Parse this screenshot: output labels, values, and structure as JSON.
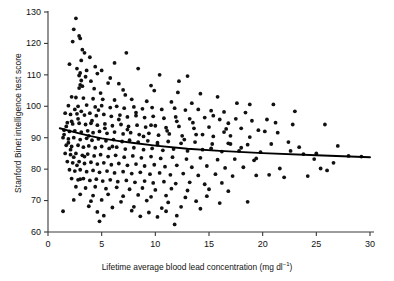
{
  "chart_data": {
    "type": "scatter",
    "title": "",
    "xlabel": "Lifetime average blood lead concentration (mg dl",
    "xlabel_sup": "−1",
    "xlabel_close": ")",
    "ylabel": "Stanford Binet intelligence test score",
    "xlim": [
      0,
      30
    ],
    "ylim": [
      60,
      130
    ],
    "xticks": [
      0,
      5,
      10,
      15,
      20,
      25,
      30
    ],
    "yticks": [
      60,
      70,
      80,
      90,
      100,
      110,
      120,
      130
    ],
    "grid": false,
    "legend": null,
    "point_color": "#111111",
    "point_radius": 1.9,
    "fit_color": "#000000",
    "fit_line": {
      "name": "regression fit",
      "x": [
        1.1,
        2.0,
        3.0,
        4.0,
        5.0,
        6.5,
        8.0,
        10.0,
        13.0,
        16.0,
        20.0,
        25.0,
        30.0
      ],
      "y": [
        93.0,
        92.2,
        91.3,
        90.5,
        89.8,
        89.0,
        88.3,
        87.5,
        86.5,
        85.8,
        85.1,
        84.4,
        83.8
      ]
    },
    "points": [
      [
        2.6,
        128.0
      ],
      [
        2.4,
        124.5
      ],
      [
        2.9,
        122.4
      ],
      [
        3.0,
        121.6
      ],
      [
        2.3,
        120.6
      ],
      [
        3.2,
        118.0
      ],
      [
        3.4,
        117.0
      ],
      [
        7.3,
        117.0
      ],
      [
        3.9,
        115.6
      ],
      [
        3.1,
        114.6
      ],
      [
        3.0,
        110.6
      ],
      [
        4.6,
        110.4
      ],
      [
        2.9,
        109.8
      ],
      [
        3.5,
        109.4
      ],
      [
        13.0,
        109.6
      ],
      [
        3.1,
        108.2
      ],
      [
        4.0,
        108.0
      ],
      [
        5.6,
        107.4
      ],
      [
        6.6,
        107.2
      ],
      [
        3.0,
        106.8
      ],
      [
        3.2,
        106.4
      ],
      [
        9.6,
        106.6
      ],
      [
        2.9,
        105.8
      ],
      [
        4.3,
        105.6
      ],
      [
        7.0,
        105.2
      ],
      [
        9.9,
        105.0
      ],
      [
        4.9,
        104.2
      ],
      [
        12.1,
        104.4
      ],
      [
        2.2,
        103.0
      ],
      [
        2.6,
        102.8
      ],
      [
        3.3,
        102.6
      ],
      [
        4.2,
        102.4
      ],
      [
        5.1,
        102.2
      ],
      [
        6.2,
        102.0
      ],
      [
        7.8,
        102.2
      ],
      [
        9.2,
        101.6
      ],
      [
        11.5,
        101.4
      ],
      [
        13.4,
        101.0
      ],
      [
        21.0,
        100.6
      ],
      [
        1.9,
        100.2
      ],
      [
        2.8,
        100.0
      ],
      [
        3.6,
        100.4
      ],
      [
        4.4,
        99.8
      ],
      [
        5.0,
        100.2
      ],
      [
        5.8,
        99.6
      ],
      [
        6.4,
        100.0
      ],
      [
        7.1,
        99.4
      ],
      [
        8.0,
        99.8
      ],
      [
        8.8,
        99.2
      ],
      [
        9.7,
        99.6
      ],
      [
        10.6,
        99.0
      ],
      [
        11.8,
        99.4
      ],
      [
        12.8,
        98.8
      ],
      [
        14.0,
        99.0
      ],
      [
        15.2,
        98.6
      ],
      [
        16.4,
        98.2
      ],
      [
        18.4,
        98.0
      ],
      [
        23.0,
        98.4
      ],
      [
        25.8,
        94.2
      ],
      [
        1.6,
        97.8
      ],
      [
        2.1,
        97.4
      ],
      [
        2.7,
        97.6
      ],
      [
        3.4,
        97.2
      ],
      [
        3.9,
        97.8
      ],
      [
        4.5,
        97.0
      ],
      [
        5.2,
        97.4
      ],
      [
        5.9,
        96.8
      ],
      [
        6.7,
        97.2
      ],
      [
        7.4,
        96.6
      ],
      [
        8.2,
        97.0
      ],
      [
        9.0,
        96.4
      ],
      [
        9.8,
        96.8
      ],
      [
        10.8,
        96.2
      ],
      [
        11.9,
        96.6
      ],
      [
        13.2,
        96.0
      ],
      [
        14.6,
        96.4
      ],
      [
        16.0,
        95.8
      ],
      [
        17.5,
        96.0
      ],
      [
        19.0,
        95.4
      ],
      [
        20.4,
        95.8
      ],
      [
        1.8,
        94.8
      ],
      [
        2.3,
        94.4
      ],
      [
        2.9,
        94.6
      ],
      [
        3.5,
        94.2
      ],
      [
        4.0,
        94.6
      ],
      [
        4.6,
        94.0
      ],
      [
        5.3,
        94.4
      ],
      [
        6.0,
        93.8
      ],
      [
        6.8,
        94.2
      ],
      [
        7.5,
        93.6
      ],
      [
        8.3,
        94.0
      ],
      [
        9.1,
        93.4
      ],
      [
        10.0,
        93.8
      ],
      [
        11.0,
        93.2
      ],
      [
        12.2,
        93.6
      ],
      [
        13.6,
        93.0
      ],
      [
        15.0,
        93.4
      ],
      [
        16.6,
        92.8
      ],
      [
        18.0,
        93.0
      ],
      [
        19.6,
        92.4
      ],
      [
        1.5,
        92.4
      ],
      [
        2.0,
        92.0
      ],
      [
        2.5,
        92.2
      ],
      [
        3.1,
        91.8
      ],
      [
        3.7,
        92.2
      ],
      [
        4.2,
        91.6
      ],
      [
        4.8,
        92.0
      ],
      [
        5.5,
        91.4
      ],
      [
        6.2,
        91.8
      ],
      [
        7.0,
        91.2
      ],
      [
        7.7,
        91.6
      ],
      [
        8.5,
        91.0
      ],
      [
        9.4,
        91.4
      ],
      [
        10.3,
        90.8
      ],
      [
        11.3,
        91.2
      ],
      [
        12.5,
        90.6
      ],
      [
        13.8,
        91.0
      ],
      [
        15.4,
        90.4
      ],
      [
        17.0,
        90.6
      ],
      [
        18.8,
        90.2
      ],
      [
        1.4,
        90.0
      ],
      [
        1.9,
        89.6
      ],
      [
        2.4,
        90.0
      ],
      [
        3.0,
        89.4
      ],
      [
        3.6,
        89.8
      ],
      [
        4.1,
        89.2
      ],
      [
        4.7,
        89.6
      ],
      [
        5.4,
        89.0
      ],
      [
        6.1,
        89.4
      ],
      [
        6.9,
        88.8
      ],
      [
        7.6,
        89.2
      ],
      [
        8.4,
        88.6
      ],
      [
        9.3,
        89.0
      ],
      [
        10.2,
        88.4
      ],
      [
        11.2,
        88.8
      ],
      [
        12.4,
        88.2
      ],
      [
        13.7,
        88.6
      ],
      [
        15.3,
        88.0
      ],
      [
        16.8,
        88.2
      ],
      [
        18.6,
        87.8
      ],
      [
        20.8,
        88.0
      ],
      [
        1.7,
        87.6
      ],
      [
        2.2,
        87.2
      ],
      [
        2.8,
        87.6
      ],
      [
        3.3,
        87.0
      ],
      [
        3.8,
        87.4
      ],
      [
        4.4,
        86.8
      ],
      [
        5.0,
        87.2
      ],
      [
        5.7,
        86.6
      ],
      [
        6.4,
        87.0
      ],
      [
        7.2,
        86.4
      ],
      [
        8.0,
        86.8
      ],
      [
        8.9,
        86.2
      ],
      [
        9.7,
        86.6
      ],
      [
        10.7,
        86.0
      ],
      [
        11.7,
        86.4
      ],
      [
        13.0,
        85.8
      ],
      [
        14.4,
        86.2
      ],
      [
        16.2,
        85.6
      ],
      [
        17.8,
        85.8
      ],
      [
        19.8,
        85.4
      ],
      [
        22.6,
        85.8
      ],
      [
        25.0,
        85.0
      ],
      [
        1.6,
        85.0
      ],
      [
        2.1,
        84.6
      ],
      [
        2.6,
        85.0
      ],
      [
        3.2,
        84.4
      ],
      [
        3.7,
        84.8
      ],
      [
        4.3,
        84.2
      ],
      [
        4.9,
        84.6
      ],
      [
        5.6,
        84.0
      ],
      [
        6.3,
        84.4
      ],
      [
        7.1,
        83.8
      ],
      [
        7.9,
        84.2
      ],
      [
        8.7,
        83.6
      ],
      [
        9.6,
        84.0
      ],
      [
        10.5,
        83.4
      ],
      [
        11.6,
        83.8
      ],
      [
        12.9,
        83.2
      ],
      [
        14.2,
        83.6
      ],
      [
        15.8,
        83.0
      ],
      [
        17.4,
        83.2
      ],
      [
        19.2,
        82.8
      ],
      [
        1.8,
        82.4
      ],
      [
        2.3,
        82.0
      ],
      [
        2.9,
        82.4
      ],
      [
        3.4,
        81.8
      ],
      [
        4.0,
        82.2
      ],
      [
        4.6,
        81.6
      ],
      [
        5.2,
        82.0
      ],
      [
        5.9,
        81.4
      ],
      [
        6.6,
        81.8
      ],
      [
        7.4,
        81.2
      ],
      [
        8.2,
        81.6
      ],
      [
        9.0,
        81.0
      ],
      [
        9.9,
        81.4
      ],
      [
        10.9,
        80.8
      ],
      [
        12.0,
        81.2
      ],
      [
        13.4,
        80.6
      ],
      [
        14.8,
        81.0
      ],
      [
        16.5,
        80.4
      ],
      [
        18.2,
        80.6
      ],
      [
        21.6,
        80.2
      ],
      [
        2.0,
        79.8
      ],
      [
        2.5,
        79.4
      ],
      [
        3.0,
        79.8
      ],
      [
        3.6,
        79.2
      ],
      [
        4.2,
        79.6
      ],
      [
        4.8,
        79.0
      ],
      [
        5.5,
        79.4
      ],
      [
        6.2,
        78.8
      ],
      [
        7.0,
        79.2
      ],
      [
        7.8,
        78.6
      ],
      [
        8.6,
        79.0
      ],
      [
        9.5,
        78.4
      ],
      [
        10.4,
        78.8
      ],
      [
        11.4,
        78.2
      ],
      [
        12.6,
        78.6
      ],
      [
        14.0,
        78.0
      ],
      [
        15.6,
        78.4
      ],
      [
        17.2,
        77.8
      ],
      [
        19.4,
        78.0
      ],
      [
        22.0,
        77.4
      ],
      [
        2.2,
        77.0
      ],
      [
        2.8,
        76.6
      ],
      [
        3.3,
        77.0
      ],
      [
        3.9,
        76.4
      ],
      [
        4.5,
        76.8
      ],
      [
        5.1,
        76.2
      ],
      [
        5.8,
        76.6
      ],
      [
        6.5,
        76.0
      ],
      [
        7.3,
        76.4
      ],
      [
        8.1,
        75.8
      ],
      [
        9.0,
        76.2
      ],
      [
        9.8,
        75.6
      ],
      [
        10.8,
        76.0
      ],
      [
        11.9,
        75.4
      ],
      [
        13.2,
        75.8
      ],
      [
        14.6,
        75.2
      ],
      [
        16.2,
        75.6
      ],
      [
        2.6,
        74.4
      ],
      [
        3.5,
        74.0
      ],
      [
        4.4,
        74.4
      ],
      [
        5.4,
        73.8
      ],
      [
        6.4,
        74.2
      ],
      [
        7.6,
        73.6
      ],
      [
        8.8,
        74.0
      ],
      [
        10.0,
        73.4
      ],
      [
        11.5,
        73.8
      ],
      [
        13.0,
        73.2
      ],
      [
        15.0,
        73.6
      ],
      [
        16.8,
        73.0
      ],
      [
        3.0,
        72.0
      ],
      [
        4.2,
        71.6
      ],
      [
        5.6,
        72.0
      ],
      [
        7.0,
        71.4
      ],
      [
        8.4,
        71.8
      ],
      [
        9.6,
        71.2
      ],
      [
        11.0,
        71.6
      ],
      [
        12.8,
        71.0
      ],
      [
        14.8,
        71.4
      ],
      [
        2.4,
        70.2
      ],
      [
        4.0,
        69.8
      ],
      [
        5.0,
        70.2
      ],
      [
        6.8,
        69.6
      ],
      [
        9.2,
        70.0
      ],
      [
        11.2,
        69.4
      ],
      [
        13.8,
        69.8
      ],
      [
        16.0,
        69.2
      ],
      [
        18.6,
        69.6
      ],
      [
        3.8,
        68.2
      ],
      [
        6.0,
        67.8
      ],
      [
        8.0,
        68.0
      ],
      [
        10.6,
        67.6
      ],
      [
        12.4,
        68.0
      ],
      [
        14.2,
        67.4
      ],
      [
        1.4,
        66.6
      ],
      [
        4.6,
        66.4
      ],
      [
        7.8,
        66.8
      ],
      [
        9.4,
        66.2
      ],
      [
        11.0,
        66.6
      ],
      [
        5.2,
        65.2
      ],
      [
        8.6,
        65.0
      ],
      [
        10.2,
        64.8
      ],
      [
        12.0,
        65.2
      ],
      [
        4.8,
        63.4
      ],
      [
        11.8,
        62.4
      ],
      [
        15.4,
        97.0
      ],
      [
        16.8,
        94.6
      ],
      [
        18.0,
        86.8
      ],
      [
        19.4,
        83.4
      ],
      [
        20.2,
        92.0
      ],
      [
        20.6,
        78.2
      ],
      [
        21.4,
        91.6
      ],
      [
        22.4,
        88.6
      ],
      [
        23.4,
        87.0
      ],
      [
        24.2,
        77.8
      ],
      [
        25.4,
        80.2
      ],
      [
        26.6,
        82.0
      ],
      [
        27.0,
        87.4
      ],
      [
        28.0,
        84.2
      ],
      [
        29.2,
        84.0
      ],
      [
        22.8,
        94.2
      ],
      [
        21.2,
        94.8
      ],
      [
        23.8,
        84.8
      ],
      [
        24.8,
        83.2
      ],
      [
        26.0,
        79.6
      ],
      [
        17.6,
        101.0
      ],
      [
        18.8,
        100.6
      ],
      [
        15.8,
        103.0
      ],
      [
        14.2,
        104.0
      ],
      [
        12.2,
        108.0
      ],
      [
        10.4,
        110.0
      ],
      [
        8.4,
        112.0
      ],
      [
        6.2,
        113.8
      ],
      [
        5.0,
        111.4
      ],
      [
        4.4,
        112.6
      ],
      [
        2.0,
        113.4
      ],
      [
        2.7,
        112.0
      ],
      [
        3.6,
        111.4
      ],
      [
        5.8,
        109.0
      ],
      [
        7.2,
        103.6
      ],
      [
        2.5,
        99.0
      ],
      [
        3.1,
        98.4
      ],
      [
        2.8,
        96.0
      ],
      [
        2.2,
        95.2
      ],
      [
        1.7,
        93.6
      ],
      [
        1.5,
        91.0
      ],
      [
        1.9,
        88.4
      ],
      [
        2.1,
        86.2
      ],
      [
        2.4,
        83.8
      ],
      [
        2.7,
        81.2
      ],
      [
        3.0,
        76.8
      ],
      [
        3.4,
        84.0
      ],
      [
        3.8,
        90.6
      ],
      [
        4.1,
        95.4
      ],
      [
        4.7,
        98.8
      ],
      [
        5.3,
        93.0
      ],
      [
        6.0,
        87.2
      ],
      [
        6.6,
        95.8
      ],
      [
        7.4,
        92.6
      ],
      [
        8.2,
        98.0
      ],
      [
        8.9,
        90.4
      ],
      [
        9.6,
        94.0
      ],
      [
        10.2,
        87.8
      ],
      [
        11.1,
        92.2
      ],
      [
        12.0,
        95.2
      ],
      [
        12.7,
        89.4
      ],
      [
        13.5,
        94.8
      ],
      [
        14.4,
        91.0
      ],
      [
        15.2,
        86.6
      ],
      [
        16.4,
        91.8
      ],
      [
        17.0,
        88.0
      ]
    ]
  }
}
